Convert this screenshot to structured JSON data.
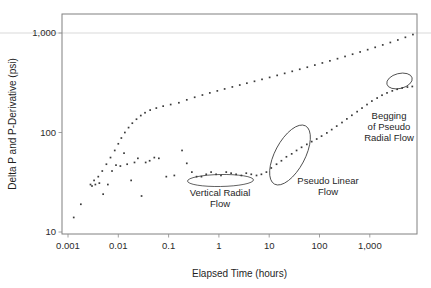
{
  "chart_data": {
    "type": "scatter",
    "title": "",
    "xlabel": "Elapsed Time (hours)",
    "ylabel": "Delta P and P-Derivative (psi)",
    "xscale": "log",
    "yscale": "log",
    "xlim": [
      0.0005,
      10000
    ],
    "ylim": [
      8,
      2000
    ],
    "xticks": [
      "0.001",
      "0.01",
      "0.1",
      "1",
      "10",
      "100",
      "1,000"
    ],
    "xtick_values": [
      0.001,
      0.01,
      0.1,
      1,
      10,
      100,
      1000
    ],
    "yticks": [
      "10",
      "100",
      "1,000"
    ],
    "ytick_values": [
      10,
      100,
      1000
    ],
    "grid": "horizontal-at-1000-only",
    "legend": "none",
    "marker": "small-square-dot",
    "marker_color": "#3a3a3a",
    "series": [
      {
        "name": "Delta P",
        "points": [
          [
            0.0013,
            14
          ],
          [
            0.0018,
            19
          ],
          [
            0.0028,
            30
          ],
          [
            0.0033,
            33
          ],
          [
            0.004,
            36
          ],
          [
            0.0048,
            41
          ],
          [
            0.0058,
            48
          ],
          [
            0.007,
            56
          ],
          [
            0.0085,
            66
          ],
          [
            0.01,
            77
          ],
          [
            0.0115,
            88
          ],
          [
            0.0135,
            100
          ],
          [
            0.016,
            112
          ],
          [
            0.019,
            124
          ],
          [
            0.023,
            136
          ],
          [
            0.028,
            148
          ],
          [
            0.034,
            158
          ],
          [
            0.043,
            168
          ],
          [
            0.057,
            176
          ],
          [
            0.078,
            184
          ],
          [
            0.11,
            191
          ],
          [
            0.16,
            199
          ],
          [
            0.23,
            213
          ],
          [
            0.33,
            226
          ],
          [
            0.47,
            238
          ],
          [
            0.66,
            250
          ],
          [
            0.93,
            262
          ],
          [
            1.3,
            274
          ],
          [
            1.85,
            287
          ],
          [
            2.6,
            300
          ],
          [
            3.6,
            313
          ],
          [
            5.1,
            327
          ],
          [
            7.2,
            342
          ],
          [
            10.2,
            358
          ],
          [
            14.4,
            375
          ],
          [
            20.3,
            393
          ],
          [
            28.7,
            412
          ],
          [
            40.5,
            432
          ],
          [
            57.2,
            453
          ],
          [
            80.8,
            476
          ],
          [
            114,
            500
          ],
          [
            161,
            525
          ],
          [
            228,
            552
          ],
          [
            322,
            581
          ],
          [
            455,
            612
          ],
          [
            642,
            645
          ],
          [
            907,
            680
          ],
          [
            1280,
            718
          ],
          [
            1810,
            759
          ],
          [
            2560,
            803
          ],
          [
            3610,
            851
          ],
          [
            5100,
            905
          ],
          [
            7200,
            965
          ],
          [
            9000,
            1010
          ],
          [
            11000,
            1065
          ]
        ]
      },
      {
        "name": "Pressure Derivative",
        "points": [
          [
            0.003,
            29
          ],
          [
            0.0035,
            30
          ],
          [
            0.0042,
            31
          ],
          [
            0.005,
            24
          ],
          [
            0.0062,
            30
          ],
          [
            0.0075,
            41
          ],
          [
            0.009,
            47
          ],
          [
            0.011,
            46
          ],
          [
            0.013,
            62
          ],
          [
            0.015,
            48
          ],
          [
            0.018,
            33
          ],
          [
            0.021,
            50
          ],
          [
            0.0245,
            55
          ],
          [
            0.029,
            23
          ],
          [
            0.035,
            50
          ],
          [
            0.042,
            52
          ],
          [
            0.052,
            56
          ],
          [
            0.064,
            55
          ],
          [
            0.09,
            36
          ],
          [
            0.13,
            37
          ],
          [
            0.185,
            66
          ],
          [
            0.23,
            49
          ],
          [
            0.29,
            40
          ],
          [
            0.36,
            36
          ],
          [
            0.45,
            36
          ],
          [
            0.56,
            38
          ],
          [
            0.7,
            40
          ],
          [
            0.88,
            38
          ],
          [
            1.1,
            37
          ],
          [
            1.4,
            40
          ],
          [
            1.75,
            39
          ],
          [
            2.2,
            38
          ],
          [
            2.8,
            37
          ],
          [
            3.5,
            39
          ],
          [
            4.4,
            38
          ],
          [
            5.6,
            37
          ],
          [
            7.0,
            38
          ],
          [
            8.8,
            40
          ],
          [
            11.0,
            44
          ],
          [
            14.0,
            48
          ],
          [
            17.5,
            52
          ],
          [
            22.0,
            57
          ],
          [
            28.0,
            61
          ],
          [
            35.0,
            66
          ],
          [
            44.0,
            71
          ],
          [
            56.0,
            76
          ],
          [
            70.0,
            81
          ],
          [
            88.0,
            86
          ],
          [
            110,
            92
          ],
          [
            140,
            99
          ],
          [
            175,
            107
          ],
          [
            220,
            116
          ],
          [
            280,
            126
          ],
          [
            350,
            137
          ],
          [
            440,
            149
          ],
          [
            560,
            162
          ],
          [
            700,
            176
          ],
          [
            880,
            191
          ],
          [
            1100,
            207
          ],
          [
            1400,
            222
          ],
          [
            1750,
            237
          ],
          [
            2200,
            250
          ],
          [
            2800,
            262
          ],
          [
            3500,
            272
          ],
          [
            4400,
            280
          ],
          [
            5600,
            286
          ],
          [
            7000,
            290
          ]
        ]
      }
    ],
    "annotations": [
      {
        "id": "vertical-radial-flow",
        "label_lines": [
          "Vertical Radial",
          "Flow"
        ],
        "ellipse": {
          "cx": 220.5,
          "cy": 180.5,
          "rx": 33,
          "ry": 6,
          "rotate": -1
        },
        "label_x": 220,
        "label_y": 196
      },
      {
        "id": "pseudo-linear-flow",
        "label_lines": [
          "Pseudo Linear",
          "Flow"
        ],
        "ellipse": {
          "cx": 290,
          "cy": 155,
          "rx": 33,
          "ry": 15,
          "rotate": -62
        },
        "label_x": 328,
        "label_y": 184
      },
      {
        "id": "begging-of-pseudo-radial-flow",
        "label_lines": [
          "Begging",
          "of Pseudo",
          "Radial Flow"
        ],
        "ellipse": {
          "cx": 399.5,
          "cy": 81,
          "rx": 13,
          "ry": 7.5,
          "rotate": -14
        },
        "label_x": 389,
        "label_y": 119
      }
    ]
  }
}
